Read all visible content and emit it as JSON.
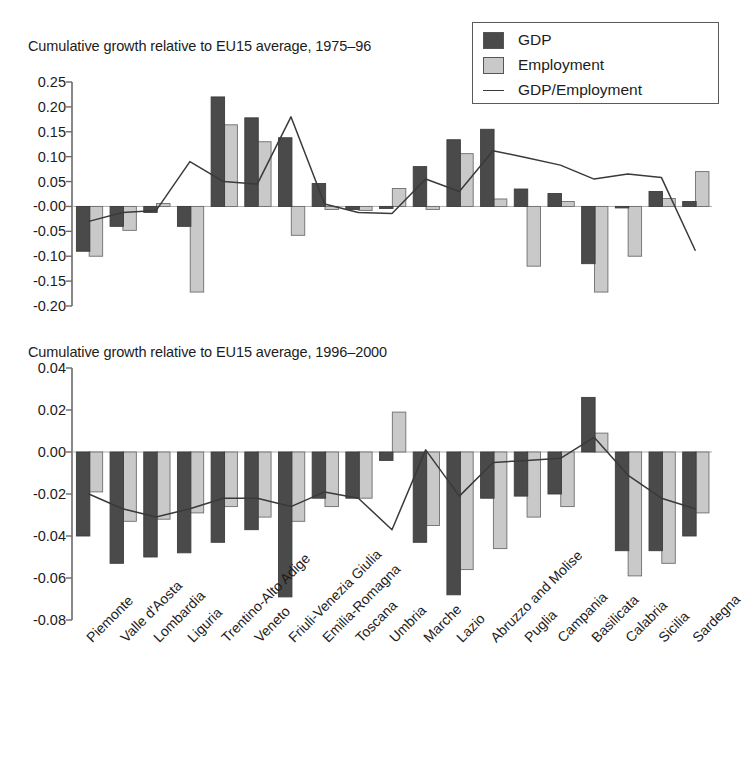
{
  "legend": {
    "items": [
      {
        "label": "GDP",
        "type": "swatch",
        "color": "#4a4a4a",
        "icon": "gdp-swatch-icon"
      },
      {
        "label": "Employment",
        "type": "swatch",
        "color": "#c9c9c9",
        "icon": "employment-swatch-icon"
      },
      {
        "label": "GDP/Employment",
        "type": "line",
        "color": "#3a3a3a",
        "icon": "ratio-line-icon"
      }
    ]
  },
  "categories": [
    "Piemonte",
    "Valle d'Aosta",
    "Lombardia",
    "Liguria",
    "Trentino-Alto Adige",
    "Veneto",
    "Friuli-Venezia Giulia",
    "Emilia-Romagna",
    "Toscana",
    "Umbria",
    "Marche",
    "Lazio",
    "Abruzzo and Molise",
    "Puglia",
    "Campania",
    "Basilicata",
    "Calabria",
    "Sicilia",
    "Sardegna"
  ],
  "chart_data": [
    {
      "id": "top",
      "type": "bar",
      "title": "Cumulative growth relative to EU15 average, 1975–96",
      "xlabel": "",
      "ylabel": "",
      "ylim": [
        -0.2,
        0.25
      ],
      "yticks": [
        0.25,
        0.2,
        0.15,
        0.1,
        0.05,
        -0.0,
        -0.05,
        -0.1,
        -0.15,
        -0.2
      ],
      "ytick_labels": [
        "0.25",
        "0.20",
        "0.15",
        "0.10",
        "0.05",
        "-0.00",
        "-0.05",
        "-0.10",
        "-0.15",
        "-0.20"
      ],
      "grid": false,
      "legend_position": "top-right",
      "categories": [
        "Piemonte",
        "Valle d'Aosta",
        "Lombardia",
        "Liguria",
        "Trentino-Alto Adige",
        "Veneto",
        "Friuli-Venezia Giulia",
        "Emilia-Romagna",
        "Toscana",
        "Umbria",
        "Marche",
        "Lazio",
        "Abruzzo and Molise",
        "Puglia",
        "Campania",
        "Basilicata",
        "Calabria",
        "Sicilia",
        "Sardegna"
      ],
      "series": [
        {
          "name": "GDP",
          "color": "#4a4a4a",
          "values": [
            -0.09,
            -0.04,
            -0.012,
            -0.04,
            0.22,
            0.178,
            0.138,
            0.046,
            -0.006,
            -0.004,
            0.08,
            0.134,
            0.155,
            0.035,
            0.026,
            -0.115,
            -0.003,
            0.03,
            0.01
          ]
        },
        {
          "name": "Employment",
          "color": "#c9c9c9",
          "values": [
            -0.1,
            -0.048,
            0.006,
            -0.172,
            0.164,
            0.13,
            -0.058,
            -0.006,
            -0.008,
            0.036,
            -0.006,
            0.106,
            0.015,
            -0.12,
            0.01,
            -0.172,
            -0.1,
            0.016,
            0.07
          ]
        },
        {
          "name": "GDP/Employment",
          "color": "#3a3a3a",
          "type": "line",
          "values": [
            -0.03,
            -0.012,
            -0.008,
            0.09,
            0.05,
            0.045,
            0.18,
            0.005,
            -0.012,
            -0.014,
            0.055,
            0.03,
            0.112,
            0.098,
            0.083,
            0.055,
            0.065,
            0.058,
            -0.088
          ]
        }
      ]
    },
    {
      "id": "bottom",
      "type": "bar",
      "title": "Cumulative growth relative to EU15 average, 1996–2000",
      "xlabel": "",
      "ylabel": "",
      "ylim": [
        -0.08,
        0.04
      ],
      "yticks": [
        0.04,
        0.02,
        0.0,
        -0.02,
        -0.04,
        -0.06,
        -0.08
      ],
      "ytick_labels": [
        "0.04",
        "0.02",
        "0.00",
        "-0.02",
        "-0.04",
        "-0.06",
        "-0.08"
      ],
      "grid": false,
      "legend_position": "none",
      "categories": [
        "Piemonte",
        "Valle d'Aosta",
        "Lombardia",
        "Liguria",
        "Trentino-Alto Adige",
        "Veneto",
        "Friuli-Venezia Giulia",
        "Emilia-Romagna",
        "Toscana",
        "Umbria",
        "Marche",
        "Lazio",
        "Abruzzo and Molise",
        "Puglia",
        "Campania",
        "Basilicata",
        "Calabria",
        "Sicilia",
        "Sardegna"
      ],
      "series": [
        {
          "name": "GDP",
          "color": "#4a4a4a",
          "values": [
            -0.04,
            -0.053,
            -0.05,
            -0.048,
            -0.043,
            -0.037,
            -0.069,
            -0.022,
            -0.022,
            -0.004,
            -0.043,
            -0.068,
            -0.022,
            -0.021,
            -0.02,
            0.026,
            -0.047,
            -0.047,
            -0.04
          ]
        },
        {
          "name": "Employment",
          "color": "#c9c9c9",
          "values": [
            -0.019,
            -0.033,
            -0.032,
            -0.029,
            -0.026,
            -0.031,
            -0.033,
            -0.026,
            -0.022,
            0.019,
            -0.035,
            -0.056,
            -0.046,
            -0.031,
            -0.026,
            0.009,
            -0.059,
            -0.053,
            -0.029
          ]
        },
        {
          "name": "GDP/Employment",
          "color": "#3a3a3a",
          "values": [
            -0.02,
            -0.027,
            -0.031,
            -0.027,
            -0.022,
            -0.022,
            -0.026,
            -0.019,
            -0.022,
            -0.037,
            0.001,
            -0.021,
            -0.005,
            -0.004,
            -0.003,
            0.007,
            -0.011,
            -0.022,
            -0.027
          ]
        }
      ]
    }
  ]
}
